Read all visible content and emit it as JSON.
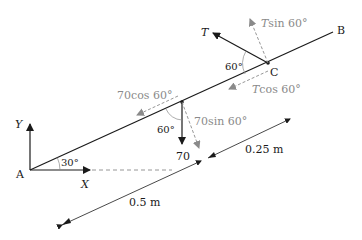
{
  "diagram": {
    "points": {
      "A": "A",
      "B": "B",
      "C": "C"
    },
    "axes": {
      "x_label": "X",
      "y_label": "Y"
    },
    "angles": {
      "beam_angle": "30°",
      "angle_at_C": "60°",
      "angle_at_mid": "60°"
    },
    "forces": {
      "tension": "T",
      "tension_sin": "Tsin 60°",
      "tension_cos": "Tcos 60°",
      "weight": "70",
      "weight_cos": "70cos 60°",
      "weight_sin": "70sin 60°"
    },
    "dimensions": {
      "first_segment": "0.5 m",
      "second_segment": "0.25 m"
    },
    "colors": {
      "primary": "#1a1a1a",
      "component": "#8a8a8a"
    }
  }
}
